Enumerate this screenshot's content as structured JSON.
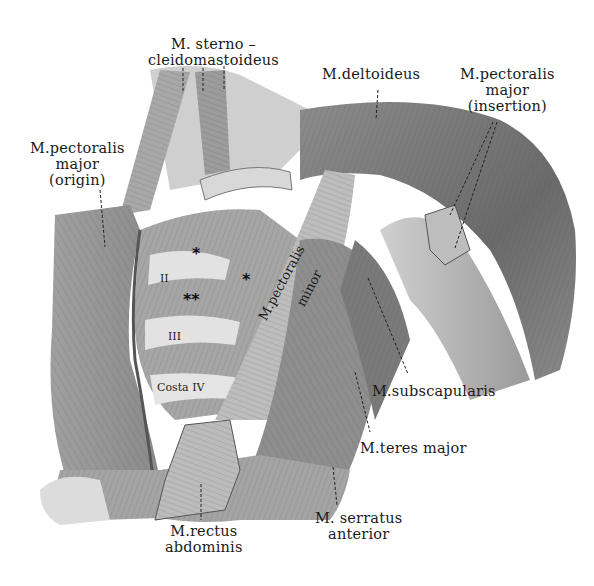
{
  "figure": {
    "colors": {
      "background": "#ffffff",
      "muscle_dark": "#6e6e6e",
      "muscle_mid": "#9a9a9a",
      "muscle_light": "#c8c8c8",
      "bone": "#dcdcdc",
      "text": "#1a1a1a"
    }
  },
  "labels": {
    "sternocleidomastoideus": {
      "line1": "M. sterno –",
      "line2": "cleidomastoideus"
    },
    "deltoideus": {
      "line1": "M.deltoideus"
    },
    "pectoralis_major_insertion": {
      "line1": "M.pectoralis",
      "line2": "major",
      "line3": "(insertion)"
    },
    "pectoralis_major_origin": {
      "line1": "M.pectoralis",
      "line2": "major",
      "line3": "(origin)"
    },
    "pectoralis_minor": {
      "line1": "M.pectoralis",
      "line2": "minor"
    },
    "subscapularis": {
      "line1": "M.subscapularis"
    },
    "teres_major": {
      "line1": "M.teres major"
    },
    "serratus_anterior": {
      "line1": "M. serratus",
      "line2": "anterior"
    },
    "rectus_abdominis": {
      "line1": "M.rectus",
      "line2": "abdominis"
    }
  },
  "ribs": {
    "rib2": "II",
    "rib3": "III",
    "rib4": "Costa IV"
  },
  "markers": {
    "single_star_1": "*",
    "single_star_2": "*",
    "double_star": "**"
  }
}
